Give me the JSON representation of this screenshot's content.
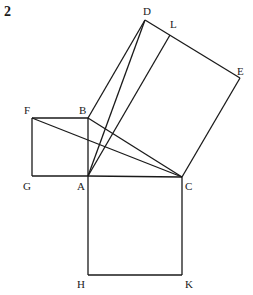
{
  "figure": {
    "number": "2"
  },
  "points": {
    "A": {
      "label": "A",
      "x": 88,
      "y": 176,
      "lx": 77,
      "ly": 190
    },
    "B": {
      "label": "B",
      "x": 88,
      "y": 118,
      "lx": 79,
      "ly": 114
    },
    "C": {
      "label": "C",
      "x": 182,
      "y": 177,
      "lx": 185,
      "ly": 190
    },
    "D": {
      "label": "D",
      "x": 145,
      "y": 20,
      "lx": 143,
      "ly": 15
    },
    "E": {
      "label": "E",
      "x": 240,
      "y": 78,
      "lx": 237,
      "ly": 75
    },
    "F": {
      "label": "F",
      "x": 32,
      "y": 118,
      "lx": 24,
      "ly": 114
    },
    "G": {
      "label": "G",
      "x": 32,
      "y": 176,
      "lx": 23,
      "ly": 190
    },
    "H": {
      "label": "H",
      "x": 88,
      "y": 275,
      "lx": 77,
      "ly": 288
    },
    "K": {
      "label": "K",
      "x": 182,
      "y": 275,
      "lx": 185,
      "ly": 288
    },
    "L": {
      "label": "L",
      "x": 170,
      "y": 35,
      "lx": 170,
      "ly": 28
    }
  },
  "segments": [
    [
      "F",
      "B"
    ],
    [
      "B",
      "A"
    ],
    [
      "A",
      "G"
    ],
    [
      "G",
      "F"
    ],
    [
      "A",
      "C"
    ],
    [
      "C",
      "K"
    ],
    [
      "K",
      "H"
    ],
    [
      "H",
      "A"
    ],
    [
      "B",
      "D"
    ],
    [
      "D",
      "E"
    ],
    [
      "E",
      "C"
    ],
    [
      "B",
      "C"
    ],
    [
      "F",
      "C"
    ],
    [
      "A",
      "D"
    ],
    [
      "A",
      "L"
    ]
  ]
}
